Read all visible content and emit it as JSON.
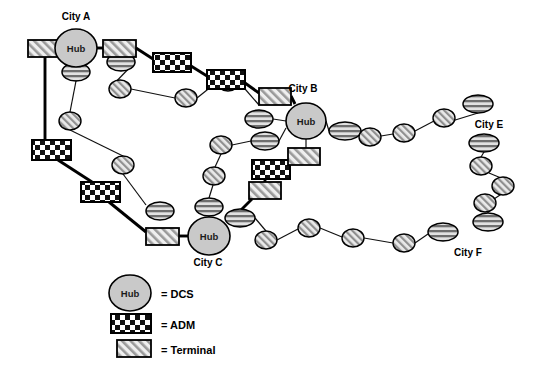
{
  "diagram": {
    "background_color": "#ffffff",
    "line_color": "#000000",
    "hub_fill": "#c9c9c9",
    "node_fill": "#d9d9d9",
    "hub_label": "Hub"
  },
  "city_labels": [
    {
      "id": "city-a",
      "text": "City A",
      "x": 76,
      "y": 16
    },
    {
      "id": "city-b",
      "text": "City B",
      "x": 303,
      "y": 88
    },
    {
      "id": "city-c",
      "text": "City C",
      "x": 208,
      "y": 262
    },
    {
      "id": "city-e",
      "text": "City E",
      "x": 489,
      "y": 131
    },
    {
      "id": "city-f",
      "text": "City F",
      "x": 468,
      "y": 255
    }
  ],
  "hubs": [
    {
      "id": "hub-city-a",
      "label": "Hub",
      "cx": 76,
      "cy": 48,
      "rx": 21,
      "ry": 19
    },
    {
      "id": "hub-city-b",
      "label": "Hub",
      "cx": 306,
      "cy": 121,
      "rx": 20,
      "ry": 18
    },
    {
      "id": "hub-city-c",
      "label": "Hub",
      "cx": 209,
      "cy": 236,
      "rx": 21,
      "ry": 19
    }
  ],
  "terminals": [
    {
      "id": "terminal-a-west",
      "x": 28,
      "y": 40,
      "w": 34,
      "h": 17
    },
    {
      "id": "terminal-a-east",
      "x": 103,
      "y": 40,
      "w": 33,
      "h": 17
    },
    {
      "id": "terminal-ne",
      "x": 259,
      "y": 88,
      "w": 32,
      "h": 17
    },
    {
      "id": "terminal-b-south",
      "x": 288,
      "y": 148,
      "w": 32,
      "h": 17
    },
    {
      "id": "terminal-mid-low",
      "x": 249,
      "y": 182,
      "w": 32,
      "h": 17
    },
    {
      "id": "terminal-c-west",
      "x": 146,
      "y": 228,
      "w": 33,
      "h": 17
    }
  ],
  "adms": [
    {
      "id": "adm-top-1",
      "x": 153,
      "y": 53,
      "w": 38,
      "h": 19
    },
    {
      "id": "adm-top-2",
      "x": 207,
      "y": 70,
      "w": 38,
      "h": 19
    },
    {
      "id": "adm-west-1",
      "x": 32,
      "y": 140,
      "w": 39,
      "h": 20
    },
    {
      "id": "adm-west-2",
      "x": 81,
      "y": 182,
      "w": 39,
      "h": 20
    },
    {
      "id": "adm-mid",
      "x": 252,
      "y": 160,
      "w": 38,
      "h": 19
    }
  ],
  "striped_nodes": [
    {
      "id": "stripe-a-1",
      "cx": 76,
      "cy": 72,
      "rx": 14,
      "ry": 9
    },
    {
      "id": "stripe-a-2",
      "cx": 121,
      "cy": 62,
      "rx": 14,
      "ry": 9
    },
    {
      "id": "stripe-w-1",
      "cx": 160,
      "cy": 211,
      "rx": 14,
      "ry": 9
    },
    {
      "id": "stripe-b-1",
      "cx": 259,
      "cy": 119,
      "rx": 14,
      "ry": 9
    },
    {
      "id": "stripe-b-2",
      "cx": 265,
      "cy": 141,
      "rx": 14,
      "ry": 9
    },
    {
      "id": "stripe-b-3",
      "cx": 209,
      "cy": 207,
      "rx": 14,
      "ry": 9
    },
    {
      "id": "stripe-c-1",
      "cx": 240,
      "cy": 218,
      "rx": 15,
      "ry": 9
    },
    {
      "id": "stripe-b-east",
      "cx": 345,
      "cy": 131,
      "rx": 16,
      "ry": 9
    },
    {
      "id": "stripe-e-top",
      "cx": 478,
      "cy": 104,
      "rx": 15,
      "ry": 9
    },
    {
      "id": "stripe-e-mid",
      "cx": 484,
      "cy": 143,
      "rx": 15,
      "ry": 9
    },
    {
      "id": "stripe-e-low",
      "cx": 488,
      "cy": 222,
      "rx": 15,
      "ry": 9
    },
    {
      "id": "stripe-f-1",
      "cx": 443,
      "cy": 232,
      "rx": 15,
      "ry": 9
    }
  ],
  "hatched_nodes": [
    {
      "id": "hatch-a-1",
      "cx": 70,
      "cy": 121,
      "rx": 11,
      "ry": 9
    },
    {
      "id": "hatch-a-2",
      "cx": 120,
      "cy": 89,
      "rx": 11,
      "ry": 9
    },
    {
      "id": "hatch-a-3",
      "cx": 123,
      "cy": 165,
      "rx": 11,
      "ry": 9
    },
    {
      "id": "hatch-t-1",
      "cx": 186,
      "cy": 98,
      "rx": 11,
      "ry": 9
    },
    {
      "id": "hatch-t-2",
      "cx": 228,
      "cy": 82,
      "rx": 11,
      "ry": 9
    },
    {
      "id": "hatch-m-1",
      "cx": 221,
      "cy": 145,
      "rx": 11,
      "ry": 9
    },
    {
      "id": "hatch-m-2",
      "cx": 214,
      "cy": 176,
      "rx": 11,
      "ry": 9
    },
    {
      "id": "hatch-e-1",
      "cx": 370,
      "cy": 137,
      "rx": 11,
      "ry": 9
    },
    {
      "id": "hatch-e-2",
      "cx": 404,
      "cy": 133,
      "rx": 11,
      "ry": 9
    },
    {
      "id": "hatch-e-3",
      "cx": 444,
      "cy": 118,
      "rx": 11,
      "ry": 9
    },
    {
      "id": "hatch-e-4",
      "cx": 481,
      "cy": 166,
      "rx": 11,
      "ry": 9
    },
    {
      "id": "hatch-e-5",
      "cx": 503,
      "cy": 186,
      "rx": 11,
      "ry": 9
    },
    {
      "id": "hatch-e-6",
      "cx": 485,
      "cy": 203,
      "rx": 11,
      "ry": 9
    },
    {
      "id": "hatch-f-1",
      "cx": 266,
      "cy": 240,
      "rx": 11,
      "ry": 9
    },
    {
      "id": "hatch-f-2",
      "cx": 309,
      "cy": 228,
      "rx": 11,
      "ry": 9
    },
    {
      "id": "hatch-f-3",
      "cx": 353,
      "cy": 238,
      "rx": 11,
      "ry": 9
    },
    {
      "id": "hatch-f-4",
      "cx": 404,
      "cy": 243,
      "rx": 11,
      "ry": 9
    }
  ],
  "legend": {
    "rows": [
      {
        "id": "legend-dcs",
        "shape": "hub",
        "label": "= DCS"
      },
      {
        "id": "legend-adm",
        "shape": "checker",
        "label": "= ADM"
      },
      {
        "id": "legend-terminal",
        "shape": "hatch",
        "label": "= Terminal"
      }
    ]
  }
}
